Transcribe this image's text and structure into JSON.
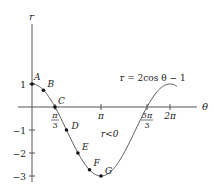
{
  "chart_data": {
    "type": "line",
    "title": "",
    "equation": "r = 2cos θ − 1",
    "xlabel": "θ",
    "ylabel": "r",
    "x_ticks": [
      "π/3",
      "π",
      "5π/3",
      "2π"
    ],
    "y_ticks": [
      "1",
      "−1",
      "−2",
      "−3"
    ],
    "xlim": [
      0,
      6.6
    ],
    "ylim": [
      -3.3,
      1.7
    ],
    "annotation": "r<0",
    "series": [
      {
        "name": "r = 2cos θ − 1",
        "function": "2*cos(theta)-1"
      }
    ],
    "points": [
      {
        "label": "A",
        "theta": 0.0,
        "r": 1.0
      },
      {
        "label": "B",
        "theta": 0.52,
        "r": 0.73
      },
      {
        "label": "C",
        "theta": 1.047,
        "r": 0.0
      },
      {
        "label": "D",
        "theta": 1.57,
        "r": -1.0
      },
      {
        "label": "E",
        "theta": 2.09,
        "r": -2.0
      },
      {
        "label": "F",
        "theta": 2.62,
        "r": -2.73
      },
      {
        "label": "G",
        "theta": 3.14,
        "r": -3.0
      }
    ],
    "grid": false,
    "legend": "none"
  },
  "labels": {
    "r_axis": "r",
    "theta_axis": "θ",
    "equation": "r = 2cos θ − 1",
    "region": "r<0",
    "y1": "1",
    "ym1": "−1",
    "ym2": "−2",
    "ym3": "−3",
    "pi": "π",
    "twopi": "2π",
    "pi3_num": "π",
    "pi3_den": "3",
    "fivepi3_num": "5π",
    "fivepi3_den": "3"
  }
}
